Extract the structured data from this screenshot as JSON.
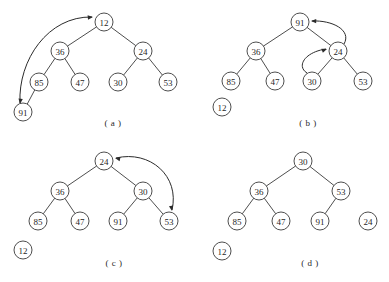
{
  "figure": {
    "background_color": "#ffffff",
    "stroke_color": "#3a3a3a",
    "arrow_color": "#2b2b2b",
    "node_radius": 9,
    "panels": [
      {
        "id": "a",
        "caption": "( a )",
        "caption_pos": {
          "x": 113,
          "y": 123
        },
        "nodes": [
          {
            "key": "a-12",
            "label": "12",
            "x": 104,
            "y": 22,
            "detached": false
          },
          {
            "key": "a-36",
            "label": "36",
            "x": 60,
            "y": 51,
            "detached": false
          },
          {
            "key": "a-24",
            "label": "24",
            "x": 143,
            "y": 51,
            "detached": false
          },
          {
            "key": "a-85",
            "label": "85",
            "x": 39,
            "y": 82,
            "detached": false
          },
          {
            "key": "a-47",
            "label": "47",
            "x": 80,
            "y": 82,
            "detached": false
          },
          {
            "key": "a-30",
            "label": "30",
            "x": 118,
            "y": 82,
            "detached": false
          },
          {
            "key": "a-53",
            "label": "53",
            "x": 168,
            "y": 82,
            "detached": false
          },
          {
            "key": "a-91",
            "label": "91",
            "x": 23,
            "y": 112,
            "detached": false
          }
        ],
        "edges": [
          {
            "from": "a-12",
            "to": "a-36"
          },
          {
            "from": "a-12",
            "to": "a-24"
          },
          {
            "from": "a-36",
            "to": "a-85"
          },
          {
            "from": "a-36",
            "to": "a-47"
          },
          {
            "from": "a-24",
            "to": "a-30"
          },
          {
            "from": "a-24",
            "to": "a-53"
          },
          {
            "from": "a-85",
            "to": "a-91"
          }
        ],
        "arrows": [
          {
            "name": "swap-91-12",
            "path": "M 20 103 C 18 60, 48 16, 92 17",
            "head_start": {
              "x": 20,
              "y": 104,
              "angle": 97
            },
            "head_end": {
              "x": 93,
              "y": 17,
              "angle": 355
            },
            "double": true
          }
        ]
      },
      {
        "id": "b",
        "caption": "( b )",
        "caption_pos": {
          "x": 308,
          "y": 123
        },
        "nodes": [
          {
            "key": "b-91",
            "label": "91",
            "x": 300,
            "y": 22,
            "detached": false
          },
          {
            "key": "b-36",
            "label": "36",
            "x": 256,
            "y": 51,
            "detached": false
          },
          {
            "key": "b-24",
            "label": "24",
            "x": 338,
            "y": 51,
            "detached": false
          },
          {
            "key": "b-85",
            "label": "85",
            "x": 231,
            "y": 81,
            "detached": false
          },
          {
            "key": "b-47",
            "label": "47",
            "x": 275,
            "y": 81,
            "detached": false
          },
          {
            "key": "b-30",
            "label": "30",
            "x": 312,
            "y": 81,
            "detached": false
          },
          {
            "key": "b-53",
            "label": "53",
            "x": 363,
            "y": 81,
            "detached": false
          },
          {
            "key": "b-12",
            "label": "12",
            "x": 222,
            "y": 107,
            "detached": true
          }
        ],
        "edges": [
          {
            "from": "b-91",
            "to": "b-36"
          },
          {
            "from": "b-91",
            "to": "b-24"
          },
          {
            "from": "b-36",
            "to": "b-85"
          },
          {
            "from": "b-36",
            "to": "b-47"
          },
          {
            "from": "b-24",
            "to": "b-30"
          },
          {
            "from": "b-24",
            "to": "b-53"
          }
        ],
        "arrows": [
          {
            "name": "move-24-to-91",
            "path": "M 344 44 C 352 30, 332 20, 312 21",
            "head_end": {
              "x": 311,
              "y": 21,
              "angle": 182
            },
            "double": false
          },
          {
            "name": "move-30-to-24",
            "path": "M 307 73 C 296 66, 305 52, 326 49",
            "head_end": {
              "x": 327,
              "y": 49,
              "angle": 340
            },
            "double": false
          }
        ]
      },
      {
        "id": "c",
        "caption": "( c )",
        "caption_pos": {
          "x": 114,
          "y": 263
        },
        "nodes": [
          {
            "key": "c-24",
            "label": "24",
            "x": 104,
            "y": 161,
            "detached": false
          },
          {
            "key": "c-36",
            "label": "36",
            "x": 60,
            "y": 191,
            "detached": false
          },
          {
            "key": "c-30",
            "label": "30",
            "x": 143,
            "y": 191,
            "detached": false
          },
          {
            "key": "c-85",
            "label": "85",
            "x": 38,
            "y": 221,
            "detached": false
          },
          {
            "key": "c-47",
            "label": "47",
            "x": 80,
            "y": 221,
            "detached": false
          },
          {
            "key": "c-91",
            "label": "91",
            "x": 118,
            "y": 221,
            "detached": false
          },
          {
            "key": "c-53",
            "label": "53",
            "x": 169,
            "y": 221,
            "detached": false
          },
          {
            "key": "c-12",
            "label": "12",
            "x": 23,
            "y": 250,
            "detached": true
          }
        ],
        "edges": [
          {
            "from": "c-24",
            "to": "c-36"
          },
          {
            "from": "c-24",
            "to": "c-30"
          },
          {
            "from": "c-36",
            "to": "c-85"
          },
          {
            "from": "c-36",
            "to": "c-47"
          },
          {
            "from": "c-30",
            "to": "c-91"
          },
          {
            "from": "c-30",
            "to": "c-53"
          }
        ],
        "arrows": [
          {
            "name": "swap-24-53",
            "path": "M 116 158 C 150 150, 180 176, 172 210",
            "head_start": {
              "x": 115,
              "y": 158,
              "angle": 193
            },
            "head_end": {
              "x": 172,
              "y": 211,
              "angle": 80
            },
            "double": true
          }
        ]
      },
      {
        "id": "d",
        "caption": "( d )",
        "caption_pos": {
          "x": 310,
          "y": 263
        },
        "nodes": [
          {
            "key": "d-30",
            "label": "30",
            "x": 303,
            "y": 161,
            "detached": false
          },
          {
            "key": "d-36",
            "label": "36",
            "x": 259,
            "y": 191,
            "detached": false
          },
          {
            "key": "d-53",
            "label": "53",
            "x": 341,
            "y": 191,
            "detached": false
          },
          {
            "key": "d-85",
            "label": "85",
            "x": 237,
            "y": 221,
            "detached": false
          },
          {
            "key": "d-47",
            "label": "47",
            "x": 281,
            "y": 221,
            "detached": false
          },
          {
            "key": "d-91",
            "label": "91",
            "x": 320,
            "y": 221,
            "detached": false
          },
          {
            "key": "d-24",
            "label": "24",
            "x": 368,
            "y": 221,
            "detached": true
          },
          {
            "key": "d-12",
            "label": "12",
            "x": 222,
            "y": 251,
            "detached": true
          }
        ],
        "edges": [
          {
            "from": "d-30",
            "to": "d-36"
          },
          {
            "from": "d-30",
            "to": "d-53"
          },
          {
            "from": "d-36",
            "to": "d-85"
          },
          {
            "from": "d-36",
            "to": "d-47"
          },
          {
            "from": "d-53",
            "to": "d-91"
          }
        ],
        "arrows": []
      }
    ]
  }
}
